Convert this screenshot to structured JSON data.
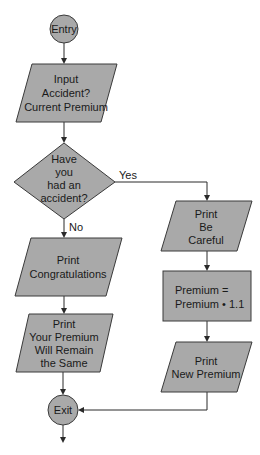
{
  "flowchart": {
    "nodes": {
      "entry": {
        "type": "terminal",
        "lines": [
          "Entry"
        ]
      },
      "input": {
        "type": "io",
        "lines": [
          "Input",
          "Accident?",
          "Current Premium"
        ]
      },
      "decision": {
        "type": "decision",
        "lines": [
          "Have",
          "you",
          "had an",
          "accident?"
        ]
      },
      "congrats": {
        "type": "io",
        "lines": [
          "Print",
          "Congratulations"
        ]
      },
      "remain": {
        "type": "io",
        "lines": [
          "Print",
          "Your Premium",
          "Will Remain",
          "the Same"
        ]
      },
      "careful": {
        "type": "io",
        "lines": [
          "Print",
          "Be",
          "Careful"
        ]
      },
      "calc": {
        "type": "process",
        "lines": [
          "Premium =",
          "Premium • 1.1"
        ]
      },
      "newprem": {
        "type": "io",
        "lines": [
          "Print",
          "New Premium"
        ]
      },
      "exit": {
        "type": "terminal",
        "lines": [
          "Exit"
        ]
      }
    },
    "edge_labels": {
      "yes": "Yes",
      "no": "No"
    },
    "colors": {
      "fill": "#a9a9a9",
      "stroke": "#3a3a3a",
      "line": "#2a2a2a",
      "background": "#ffffff"
    }
  }
}
